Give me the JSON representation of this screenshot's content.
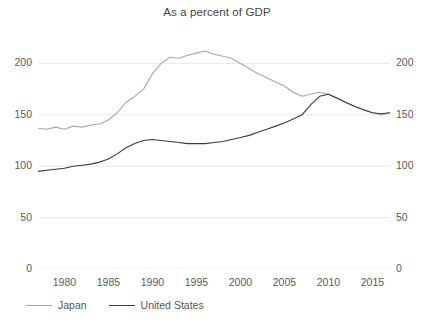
{
  "chart_data": {
    "type": "line",
    "title": "As a percent of GDP",
    "xlabel": "",
    "ylabel": "",
    "xlim": [
      1977,
      2017
    ],
    "ylim": [
      0,
      215
    ],
    "grid": true,
    "legend_position": "bottom-left",
    "xticks": [
      "1980",
      "1985",
      "1990",
      "1995",
      "2000",
      "2005",
      "2010",
      "2015"
    ],
    "xtick_values": [
      1980,
      1985,
      1990,
      1995,
      2000,
      2005,
      2010,
      2015
    ],
    "yticks_left": [
      "0",
      "50",
      "100",
      "150",
      "200"
    ],
    "yticks_right": [
      "0",
      "50",
      "100",
      "150",
      "200"
    ],
    "ytick_values": [
      0,
      50,
      100,
      150,
      200
    ],
    "colors": {
      "japan": "#a8a8a8",
      "united_states": "#3a3a3a",
      "grid": "#e8e8e8",
      "text": "#555555"
    },
    "series": [
      {
        "name": "Japan",
        "color": "#a8a8a8",
        "x": [
          1977,
          1978,
          1979,
          1980,
          1981,
          1982,
          1983,
          1984,
          1985,
          1986,
          1987,
          1988,
          1989,
          1990,
          1991,
          1992,
          1993,
          1994,
          1995,
          1996,
          1997,
          1998,
          1999,
          2000,
          2001,
          2002,
          2003,
          2004,
          2005,
          2006,
          2007,
          2008,
          2009,
          2010,
          2011,
          2012,
          2013,
          2014,
          2015,
          2016,
          2017
        ],
        "values": [
          137,
          136,
          138,
          136,
          139,
          138,
          140,
          141,
          145,
          152,
          162,
          168,
          175,
          190,
          200,
          206,
          205,
          208,
          210,
          212,
          209,
          207,
          205,
          200,
          195,
          190,
          186,
          182,
          178,
          172,
          168,
          170,
          172,
          170,
          166,
          162,
          158,
          155,
          152,
          150,
          152
        ]
      },
      {
        "name": "United States",
        "color": "#3a3a3a",
        "x": [
          1977,
          1978,
          1979,
          1980,
          1981,
          1982,
          1983,
          1984,
          1985,
          1986,
          1987,
          1988,
          1989,
          1990,
          1991,
          1992,
          1993,
          1994,
          1995,
          1996,
          1997,
          1998,
          1999,
          2000,
          2001,
          2002,
          2003,
          2004,
          2005,
          2006,
          2007,
          2008,
          2009,
          2010,
          2011,
          2012,
          2013,
          2014,
          2015,
          2016,
          2017
        ],
        "values": [
          95,
          96,
          97,
          98,
          100,
          101,
          102,
          104,
          107,
          112,
          118,
          122,
          125,
          126,
          125,
          124,
          123,
          122,
          122,
          122,
          123,
          124,
          126,
          128,
          130,
          133,
          136,
          139,
          142,
          146,
          150,
          160,
          168,
          170,
          166,
          162,
          158,
          155,
          152,
          151,
          152
        ]
      }
    ]
  },
  "legend": {
    "items": [
      {
        "label": "Japan"
      },
      {
        "label": "United States"
      }
    ]
  }
}
